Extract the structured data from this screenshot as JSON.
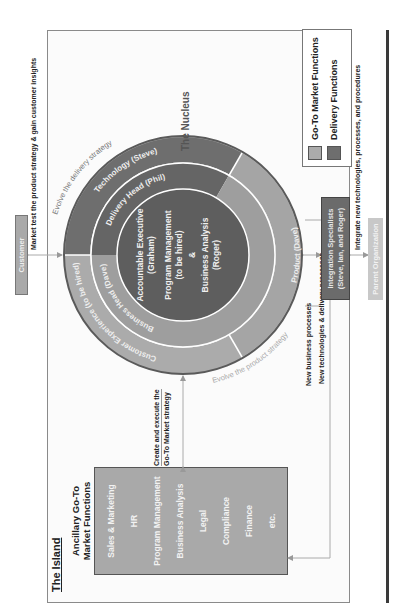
{
  "island": {
    "title": "The Island",
    "ancillary_title_line1": "Ancillary Go-To",
    "ancillary_title_line2": "Market Functions",
    "ancillary_items": [
      "Sales & Marketing",
      "HR",
      "Program Management",
      "Business Analysis",
      "Legal",
      "Compliance",
      "Finance",
      "etc."
    ]
  },
  "nucleus": {
    "title": "The Nucleus",
    "center_lines": [
      "Accountable Executive",
      "(Graham)",
      "Program Management",
      "(to be hired)",
      "&",
      "Business Analysis",
      "(Roger)"
    ],
    "middle_ring": {
      "business_head": "Business Head (Dave)",
      "delivery_head": "Delivery Head (Phil)"
    },
    "outer_ring": {
      "customer_experience": "Customer Experience (to be hired)",
      "product": "Product (Dave)",
      "technology": "Technology (Steve)"
    },
    "arc_labels": {
      "product_strategy": "Evolve the product strategy",
      "delivery_strategy": "Evolve the delivery strategy"
    }
  },
  "external": {
    "customer": "Customer",
    "integration_line1": "Integration Specialists",
    "integration_line2": "(Steve, Ian, and Roger)",
    "parent_org": "Parent Organization"
  },
  "flows": {
    "market_test": "Market test the product strategy & gain customer insights",
    "create_execute_line1": "Create and execute the",
    "create_execute_line2": "Go-To Market strategy",
    "new_business": "New business processes",
    "new_tech": "New technologies & delivery processes",
    "integrate": "Integrate new technologies, processes, and procedures"
  },
  "legend": {
    "items": [
      {
        "label": "Go-To Market Functions",
        "color": "#ababab"
      },
      {
        "label": "Delivery Functions",
        "color": "#6e6e6e"
      }
    ]
  },
  "colors": {
    "gtm_light": "#ababab",
    "gtm_mid": "#9e9e9e",
    "delivery": "#6e6e6e",
    "delivery_mid": "#656565",
    "center": "#5e5e5e",
    "outer_border": "#5a5a5a"
  }
}
